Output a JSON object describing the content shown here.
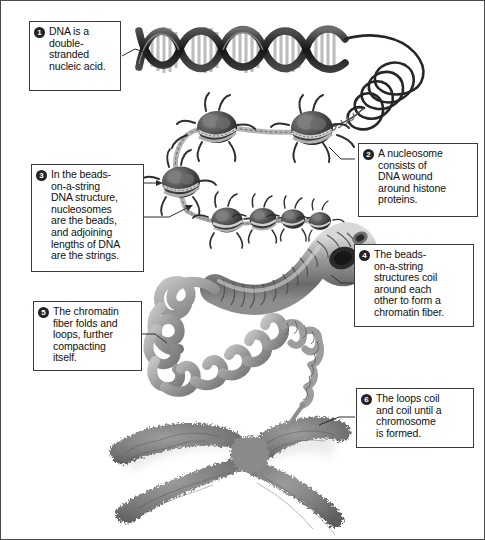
{
  "figure": {
    "background_color": "#ffffff",
    "border_color": "#4a4a4a",
    "badge_color": "#232323",
    "badge_text_color": "#ffffff",
    "callout_border_color": "#3a3a3a",
    "art_gray_dark": "#2b2b2b",
    "art_gray_mid": "#8a8a8a",
    "art_gray_light": "#c9c9c9"
  },
  "callouts": [
    {
      "number": "1",
      "text": "DNA is a\ndouble-\nstranded\nnucleic acid.",
      "name": "callout-dna-double-stranded"
    },
    {
      "number": "2",
      "text": "A nucleosome\nconsists of\nDNA wound\naround histone\nproteins.",
      "name": "callout-nucleosome"
    },
    {
      "number": "3",
      "text": "In the beads-\non-a-string\nDNA structure,\nnucleosomes\nare the beads,\nand adjoining\nlengths of DNA\nare the strings.",
      "name": "callout-beads-on-a-string"
    },
    {
      "number": "4",
      "text": "The beads-\non-a-string\nstructures coil\naround each\nother to form a\nchromatin fiber.",
      "name": "callout-chromatin-fiber"
    },
    {
      "number": "5",
      "text": "The chromatin\nfiber folds and\nloops, further\ncompacting\nitself.",
      "name": "callout-folds-and-loops"
    },
    {
      "number": "6",
      "text": "The loops coil\nand coil until a\nchromosome\nis formed.",
      "name": "callout-chromosome-formed"
    }
  ],
  "illustrations": [
    {
      "name": "dna-double-helix",
      "label": "DNA double helix"
    },
    {
      "name": "dna-coiled-tail",
      "label": "Coiled DNA strand"
    },
    {
      "name": "nucleosome-chain",
      "label": "Beads-on-a-string nucleosomes"
    },
    {
      "name": "chromatin-fiber-coil",
      "label": "Coiled chromatin fiber"
    },
    {
      "name": "chromatin-loops",
      "label": "Folded chromatin loops"
    },
    {
      "name": "chromosome",
      "label": "Condensed chromosome"
    }
  ]
}
